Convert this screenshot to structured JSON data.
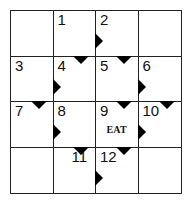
{
  "puzzle": {
    "type": "arrow-crossword",
    "rows": 4,
    "cols": 4,
    "cells": [
      {
        "row": 0,
        "col": 0,
        "number": "",
        "answer": "",
        "arrow_down": false,
        "arrow_right": false
      },
      {
        "row": 0,
        "col": 1,
        "number": "1",
        "answer": "",
        "arrow_down": false,
        "arrow_right": false
      },
      {
        "row": 0,
        "col": 2,
        "number": "2",
        "answer": "",
        "arrow_down": false,
        "arrow_right": true
      },
      {
        "row": 0,
        "col": 3,
        "number": "",
        "answer": "",
        "arrow_down": false,
        "arrow_right": false
      },
      {
        "row": 1,
        "col": 0,
        "number": "3",
        "answer": "",
        "arrow_down": false,
        "arrow_right": false
      },
      {
        "row": 1,
        "col": 1,
        "number": "4",
        "answer": "",
        "arrow_down": true,
        "arrow_right": true
      },
      {
        "row": 1,
        "col": 2,
        "number": "5",
        "answer": "",
        "arrow_down": true,
        "arrow_right": false
      },
      {
        "row": 1,
        "col": 3,
        "number": "6",
        "answer": "",
        "arrow_down": false,
        "arrow_right": true
      },
      {
        "row": 2,
        "col": 0,
        "number": "7",
        "answer": "",
        "arrow_down": true,
        "arrow_right": false
      },
      {
        "row": 2,
        "col": 1,
        "number": "8",
        "answer": "",
        "arrow_down": false,
        "arrow_right": true
      },
      {
        "row": 2,
        "col": 2,
        "number": "9",
        "answer": "EAT",
        "arrow_down": true,
        "arrow_right": false
      },
      {
        "row": 2,
        "col": 3,
        "number": "10",
        "answer": "",
        "arrow_down": true,
        "arrow_right": true
      },
      {
        "row": 3,
        "col": 0,
        "number": "",
        "answer": "",
        "arrow_down": false,
        "arrow_right": false
      },
      {
        "row": 3,
        "col": 1,
        "number": "11",
        "answer": "",
        "arrow_down": true,
        "arrow_right": false
      },
      {
        "row": 3,
        "col": 2,
        "number": "12",
        "answer": "",
        "arrow_down": true,
        "arrow_right": true
      },
      {
        "row": 3,
        "col": 3,
        "number": "",
        "answer": "",
        "arrow_down": false,
        "arrow_right": false
      }
    ]
  }
}
